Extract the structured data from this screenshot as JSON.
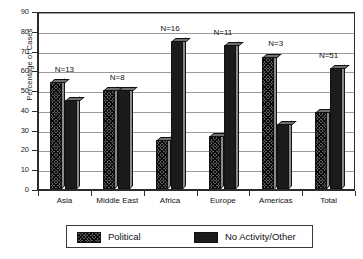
{
  "chart_data": {
    "type": "bar",
    "title": "",
    "xlabel": "",
    "ylabel": "Percentage of Cases",
    "ylim": [
      0,
      90
    ],
    "ytick_step": 10,
    "yticks": [
      0,
      10,
      20,
      30,
      40,
      50,
      60,
      70,
      80,
      90
    ],
    "grid": true,
    "legend_position": "bottom",
    "categories": [
      "Asia",
      "Middle East",
      "Africa",
      "Europe",
      "Americas",
      "Total"
    ],
    "series": [
      {
        "name": "Political",
        "values": [
          54,
          50,
          25,
          27,
          67,
          39
        ]
      },
      {
        "name": "No Activity/Other",
        "values": [
          45,
          50,
          75,
          73,
          33,
          61
        ]
      }
    ],
    "annotations": [
      {
        "category": "Asia",
        "text": "N=13"
      },
      {
        "category": "Middle East",
        "text": "N=8"
      },
      {
        "category": "Africa",
        "text": "N=16"
      },
      {
        "category": "Europe",
        "text": "N=11"
      },
      {
        "category": "Americas",
        "text": "N=3"
      },
      {
        "category": "Total",
        "text": "N=51"
      }
    ],
    "colors": {
      "political": "#5e5e5e",
      "no_activity": "#1b1b1b",
      "axis": "#2b2b2b",
      "grid": "#9b9b9b",
      "background": "#ffffff"
    }
  },
  "legend": {
    "items": [
      {
        "label": "Political",
        "swatch": "political"
      },
      {
        "label": "No Activity/Other",
        "swatch": "noactivity"
      }
    ]
  }
}
